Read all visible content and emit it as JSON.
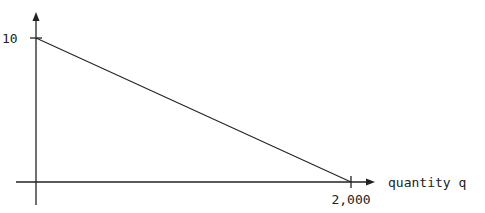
{
  "chart_data": {
    "type": "line",
    "title": "",
    "xlabel": "quantity q",
    "ylabel": "p ($)",
    "x": [
      0,
      2000
    ],
    "series": [
      {
        "name": "demand",
        "values": [
          10,
          0
        ]
      }
    ],
    "x_ticks": [
      {
        "value": 2000,
        "label": "2,000"
      }
    ],
    "y_ticks": [
      {
        "value": 10,
        "label": "10"
      }
    ],
    "xlim": [
      0,
      2000
    ],
    "ylim": [
      0,
      10
    ],
    "grid": false,
    "legend": "none"
  }
}
